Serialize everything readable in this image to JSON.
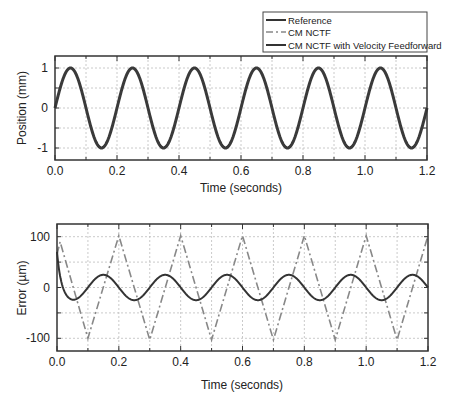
{
  "legend": {
    "entries": [
      {
        "label": "Reference",
        "style": "solid"
      },
      {
        "label": "CM NCTF",
        "style": "dashdot"
      },
      {
        "label": "CM NCTF with Velocity Feedforward",
        "style": "solid"
      }
    ]
  },
  "colors": {
    "reference": "#3a3a3a",
    "cm_nctf": "#888888",
    "cm_nctf_vff": "#333333",
    "grid": "#bdbdbd",
    "axes": "#333333"
  },
  "chart_data": [
    {
      "type": "line",
      "title": "",
      "xlabel": "Time (seconds)",
      "ylabel": "Position (mm)",
      "xlim": [
        0.0,
        1.2
      ],
      "ylim": [
        -1.3,
        1.3
      ],
      "xticks": [
        "0.0",
        "0.2",
        "0.4",
        "0.6",
        "0.8",
        "1.0",
        "1.2"
      ],
      "yticks": [
        "-1",
        "0",
        "1"
      ],
      "grid": true,
      "legend_position": "top-right, above plot",
      "series": [
        {
          "name": "Reference",
          "function": "sine",
          "amplitude": 1.0,
          "frequency_hz": 5,
          "x": [
            0.0,
            0.05,
            0.1,
            0.15,
            0.2,
            0.25,
            0.3,
            0.35,
            0.4,
            0.45,
            0.5,
            0.55,
            0.6,
            0.65,
            0.7,
            0.75,
            0.8,
            0.85,
            0.9,
            0.95,
            1.0,
            1.05,
            1.1,
            1.15,
            1.2
          ],
          "values": [
            0,
            1,
            0,
            -1,
            0,
            1,
            0,
            -1,
            0,
            1,
            0,
            -1,
            0,
            1,
            0,
            -1,
            0,
            1,
            0,
            -1,
            0,
            1,
            0,
            -1,
            0
          ]
        },
        {
          "name": "CM NCTF",
          "note": "overlaps reference in position plot",
          "x": [
            0.0,
            0.05,
            0.1,
            0.15,
            0.2,
            0.25,
            0.3,
            0.35,
            0.4,
            0.45,
            0.5,
            0.55,
            0.6,
            0.65,
            0.7,
            0.75,
            0.8,
            0.85,
            0.9,
            0.95,
            1.0,
            1.05,
            1.1,
            1.15,
            1.2
          ],
          "values": [
            0,
            1,
            0,
            -1,
            0,
            1,
            0,
            -1,
            0,
            1,
            0,
            -1,
            0,
            1,
            0,
            -1,
            0,
            1,
            0,
            -1,
            0,
            1,
            0,
            -1,
            0
          ]
        },
        {
          "name": "CM NCTF with Velocity Feedforward",
          "note": "overlaps reference in position plot",
          "x": [
            0.0,
            0.05,
            0.1,
            0.15,
            0.2,
            0.25,
            0.3,
            0.35,
            0.4,
            0.45,
            0.5,
            0.55,
            0.6,
            0.65,
            0.7,
            0.75,
            0.8,
            0.85,
            0.9,
            0.95,
            1.0,
            1.05,
            1.1,
            1.15,
            1.2
          ],
          "values": [
            0,
            1,
            0,
            -1,
            0,
            1,
            0,
            -1,
            0,
            1,
            0,
            -1,
            0,
            1,
            0,
            -1,
            0,
            1,
            0,
            -1,
            0,
            1,
            0,
            -1,
            0
          ]
        }
      ]
    },
    {
      "type": "line",
      "title": "",
      "xlabel": "Time (seconds)",
      "ylabel": "Error (µm)",
      "xlim": [
        0.0,
        1.2
      ],
      "ylim": [
        -125,
        125
      ],
      "xticks": [
        "0.0",
        "0.2",
        "0.4",
        "0.6",
        "0.8",
        "1.0",
        "1.2"
      ],
      "yticks": [
        "-100",
        "0",
        "100"
      ],
      "grid": true,
      "series": [
        {
          "name": "CM NCTF",
          "style": "dashdot",
          "x": [
            0.0,
            0.01,
            0.1,
            0.2,
            0.3,
            0.4,
            0.5,
            0.6,
            0.7,
            0.8,
            0.9,
            1.0,
            1.1,
            1.2
          ],
          "values": [
            65,
            90,
            -100,
            102,
            -103,
            102,
            -103,
            102,
            -103,
            102,
            -103,
            102,
            -103,
            102
          ]
        },
        {
          "name": "CM NCTF with Velocity Feedforward",
          "style": "solid",
          "x": [
            0.0,
            0.02,
            0.05,
            0.1,
            0.15,
            0.2,
            0.25,
            0.3,
            0.35,
            0.4,
            0.45,
            0.5,
            0.55,
            0.6,
            0.65,
            0.7,
            0.75,
            0.8,
            0.85,
            0.9,
            0.95,
            1.0,
            1.05,
            1.1,
            1.15,
            1.2
          ],
          "values": [
            70,
            0,
            -25,
            0,
            25,
            0,
            -25,
            0,
            25,
            0,
            -25,
            0,
            25,
            0,
            -25,
            0,
            25,
            0,
            -25,
            0,
            25,
            0,
            -25,
            0,
            25,
            0
          ]
        }
      ]
    }
  ]
}
